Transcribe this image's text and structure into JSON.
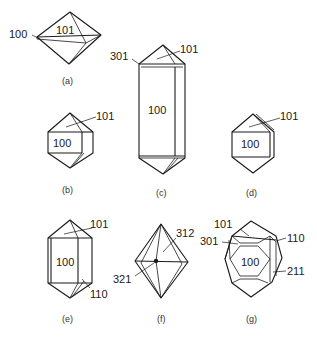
{
  "figure": {
    "panels": [
      {
        "id": "a",
        "caption": "(a)",
        "faces": [
          "100",
          "101"
        ]
      },
      {
        "id": "b",
        "caption": "(b)",
        "faces": [
          "100",
          "101"
        ]
      },
      {
        "id": "c",
        "caption": "(c)",
        "faces": [
          "301",
          "101",
          "100"
        ]
      },
      {
        "id": "d",
        "caption": "(d)",
        "faces": [
          "100",
          "101"
        ]
      },
      {
        "id": "e",
        "caption": "(e)",
        "faces": [
          "101",
          "100",
          "110"
        ]
      },
      {
        "id": "f",
        "caption": "(f)",
        "faces": [
          "312",
          "321"
        ]
      },
      {
        "id": "g",
        "caption": "(g)",
        "faces": [
          "101",
          "301",
          "110",
          "100",
          "211"
        ]
      }
    ]
  },
  "colors": {
    "line": "#1a1a1a",
    "background": "#ffffff"
  }
}
